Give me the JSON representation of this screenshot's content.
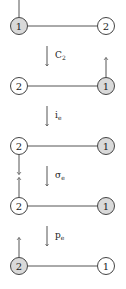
{
  "diagram": {
    "colors": {
      "line": "#555555",
      "node_stroke": "#444444",
      "shaded_fill": "#d9d9d9",
      "plain_fill": "#ffffff",
      "arrow": "#555555"
    },
    "rows": [
      {
        "y": 26,
        "left": {
          "label": "1",
          "shaded": true,
          "arrow": "up"
        },
        "right": {
          "label": "2",
          "shaded": false,
          "arrow": "none"
        }
      },
      {
        "y": 86,
        "left": {
          "label": "2",
          "shaded": false,
          "arrow": "none"
        },
        "right": {
          "label": "1",
          "shaded": true,
          "arrow": "up"
        }
      },
      {
        "y": 146,
        "left": {
          "label": "2",
          "shaded": false,
          "arrow": "down"
        },
        "right": {
          "label": "1",
          "shaded": true,
          "arrow": "none"
        }
      },
      {
        "y": 206,
        "left": {
          "label": "2",
          "shaded": false,
          "arrow": "up"
        },
        "right": {
          "label": "1",
          "shaded": true,
          "arrow": "none"
        }
      },
      {
        "y": 266,
        "left": {
          "label": "2",
          "shaded": true,
          "arrow": "up"
        },
        "right": {
          "label": "1",
          "shaded": false,
          "arrow": "none"
        }
      }
    ],
    "operations": [
      {
        "symbol": "C",
        "subscript": "2",
        "y": 56
      },
      {
        "symbol": "i",
        "subscript": "e",
        "y": 116
      },
      {
        "symbol": "σ",
        "subscript": "e",
        "y": 176
      },
      {
        "symbol": "p",
        "subscript": "e",
        "y": 236
      }
    ]
  }
}
